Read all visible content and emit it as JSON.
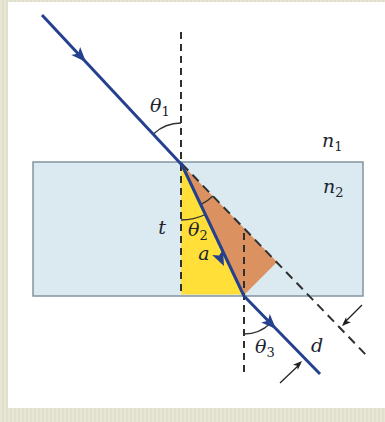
{
  "figure": {
    "type": "physics-diagram",
    "labels": {
      "theta1": {
        "base": "θ",
        "sub": "1"
      },
      "theta2": {
        "base": "θ",
        "sub": "2"
      },
      "theta3": {
        "base": "θ",
        "sub": "3"
      },
      "n1": {
        "base": "n",
        "sub": "1"
      },
      "n2": {
        "base": "n",
        "sub": "2"
      },
      "t": "t",
      "a": "a",
      "d": "d"
    },
    "bleed_text": "incident",
    "colors": {
      "ray_blue": "#24408e",
      "slab_fill": "#dbe9f1",
      "slab_border": "#8494a0",
      "triangle_yellow": "#ffdf38",
      "triangle_orange": "#dc9260",
      "dashed_line": "#2f2f2f",
      "annotation": "#1f1f1f",
      "page_beige": "#e5e3d1",
      "figure_background": "#ffffff",
      "label_color": "#20242e"
    }
  }
}
